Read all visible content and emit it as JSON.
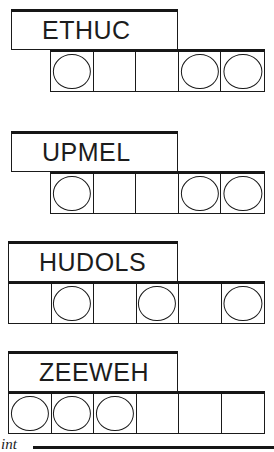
{
  "page": {
    "width": 274,
    "height": 452,
    "background": "#ffffff",
    "ink_color": "#1a1a1a",
    "bold_rule_color": "#161616"
  },
  "puzzle": {
    "type": "word-and-boxes-worksheet",
    "group_count": 4,
    "groups": [
      {
        "id": "group-1",
        "label": "ETHUC",
        "label_box": {
          "x": 11,
          "y": 9,
          "width": 167,
          "height": 41
        },
        "cell_row": {
          "x": 50,
          "y": 49,
          "width": 215,
          "height": 43
        },
        "cell_count": 5,
        "cells": [
          {
            "index": 0,
            "token": "circle"
          },
          {
            "index": 1,
            "token": "none"
          },
          {
            "index": 2,
            "token": "none"
          },
          {
            "index": 3,
            "token": "circle"
          },
          {
            "index": 4,
            "token": "circle"
          }
        ]
      },
      {
        "id": "group-2",
        "label": "UPMEL",
        "label_box": {
          "x": 11,
          "y": 131,
          "width": 167,
          "height": 41
        },
        "cell_row": {
          "x": 50,
          "y": 171,
          "width": 215,
          "height": 43
        },
        "cell_count": 5,
        "cells": [
          {
            "index": 0,
            "token": "circle"
          },
          {
            "index": 1,
            "token": "none"
          },
          {
            "index": 2,
            "token": "none"
          },
          {
            "index": 3,
            "token": "circle"
          },
          {
            "index": 4,
            "token": "circle"
          }
        ]
      },
      {
        "id": "group-3",
        "label": "HUDOLS",
        "label_box": {
          "x": 8,
          "y": 241,
          "width": 170,
          "height": 41
        },
        "cell_row": {
          "x": 8,
          "y": 281,
          "width": 257,
          "height": 43
        },
        "cell_count": 6,
        "cells": [
          {
            "index": 0,
            "token": "none"
          },
          {
            "index": 1,
            "token": "circle"
          },
          {
            "index": 2,
            "token": "none"
          },
          {
            "index": 3,
            "token": "circle"
          },
          {
            "index": 4,
            "token": "none"
          },
          {
            "index": 5,
            "token": "circle"
          }
        ]
      },
      {
        "id": "group-4",
        "label": "ZEEWEH",
        "label_box": {
          "x": 8,
          "y": 351,
          "width": 170,
          "height": 41
        },
        "cell_row": {
          "x": 8,
          "y": 391,
          "width": 257,
          "height": 43
        },
        "cell_count": 6,
        "cells": [
          {
            "index": 0,
            "token": "circle"
          },
          {
            "index": 1,
            "token": "circle"
          },
          {
            "index": 2,
            "token": "circle"
          },
          {
            "index": 3,
            "token": "none"
          },
          {
            "index": 4,
            "token": "none"
          },
          {
            "index": 5,
            "token": "none"
          }
        ]
      }
    ]
  },
  "footer": {
    "fragment_text": "int",
    "rule_visible": true
  }
}
